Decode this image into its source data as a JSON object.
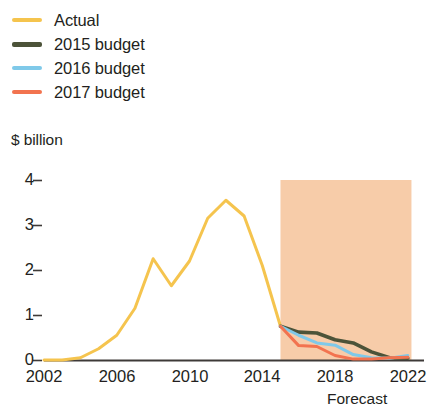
{
  "legend": {
    "items": [
      {
        "label": "Actual",
        "color": "#F5C44E",
        "weight": "thin"
      },
      {
        "label": "2015 budget",
        "color": "#4C5339",
        "weight": "thick"
      },
      {
        "label": "2016 budget",
        "color": "#7FC9E9",
        "weight": "thin"
      },
      {
        "label": "2017 budget",
        "color": "#F2734F",
        "weight": "thin"
      }
    ]
  },
  "axes": {
    "ylabel": "$ billion",
    "yticks": [
      "0",
      "1",
      "2",
      "3",
      "4"
    ],
    "xticks": [
      "2002",
      "2006",
      "2010",
      "2014",
      "2018",
      "2022"
    ]
  },
  "annotations": {
    "forecast": "Forecast"
  },
  "colors": {
    "actual": "#F5C44E",
    "budget2015": "#4C5339",
    "budget2016": "#7FC9E9",
    "budget2017": "#F2734F",
    "forecast_band": "#F7CCA9",
    "axis": "#3E3A38",
    "text": "#231f20"
  },
  "chart_data": {
    "type": "line",
    "title": "",
    "xlabel": "",
    "ylabel": "$ billion",
    "xlim": [
      2002,
      2023
    ],
    "ylim": [
      0,
      4.2
    ],
    "grid": false,
    "legend_position": "top-left",
    "yticks": [
      0,
      1,
      2,
      3,
      4
    ],
    "xticks": [
      2002,
      2006,
      2010,
      2014,
      2018,
      2022
    ],
    "annotations": [
      {
        "text": "Forecast",
        "x": 2019,
        "y": -0.55
      }
    ],
    "shaded_regions": [
      {
        "label": "Forecast",
        "x_start": 2015,
        "x_end": 2022.2,
        "y_start": 0,
        "y_end": 4.0,
        "color": "#F7CCA9"
      }
    ],
    "series": [
      {
        "name": "Actual",
        "color": "#F5C44E",
        "x": [
          2002,
          2003,
          2004,
          2005,
          2006,
          2007,
          2008,
          2009,
          2010,
          2011,
          2012,
          2013,
          2014,
          2015
        ],
        "values": [
          0.0,
          0.0,
          0.05,
          0.25,
          0.55,
          1.15,
          2.25,
          1.65,
          2.2,
          3.15,
          3.55,
          3.2,
          2.1,
          0.75
        ]
      },
      {
        "name": "2015 budget",
        "color": "#4C5339",
        "x": [
          2015,
          2016,
          2017,
          2018,
          2019,
          2020,
          2021,
          2022
        ],
        "values": [
          0.75,
          0.62,
          0.6,
          0.45,
          0.38,
          0.18,
          0.05,
          0.04
        ]
      },
      {
        "name": "2016 budget",
        "color": "#7FC9E9",
        "x": [
          2015,
          2016,
          2017,
          2018,
          2019,
          2020,
          2021,
          2022
        ],
        "values": [
          0.75,
          0.55,
          0.38,
          0.33,
          0.12,
          0.05,
          0.04,
          0.1
        ]
      },
      {
        "name": "2017 budget",
        "color": "#F2734F",
        "x": [
          2015,
          2016,
          2017,
          2018,
          2019,
          2020,
          2021,
          2022
        ],
        "values": [
          0.75,
          0.32,
          0.3,
          0.1,
          0.02,
          0.02,
          0.05,
          0.06
        ]
      }
    ]
  }
}
